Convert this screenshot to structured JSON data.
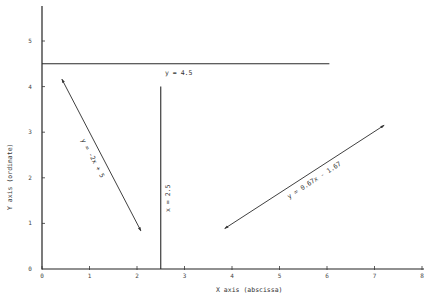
{
  "chart_data": {
    "type": "line",
    "title": "",
    "xlabel": "X axis (abscissa)",
    "ylabel": "Y axis (ordinate)",
    "xlim": [
      0,
      8
    ],
    "ylim": [
      0,
      5.6
    ],
    "x_ticks": [
      "0",
      "1",
      "2",
      "3",
      "4",
      "5",
      "6",
      "7",
      "8"
    ],
    "y_ticks": [
      "0",
      "1",
      "2",
      "3",
      "4",
      "5"
    ],
    "grid": false,
    "legend": "none",
    "series": [
      {
        "name": "y = 4.5",
        "kind": "horizontal",
        "points": [
          [
            0,
            4.5
          ],
          [
            6.05,
            4.5
          ]
        ],
        "arrows": false
      },
      {
        "name": "x = 2.5",
        "kind": "vertical",
        "points": [
          [
            2.5,
            0
          ],
          [
            2.5,
            4.0
          ]
        ],
        "arrows": false
      },
      {
        "name": "y = -2x + 5",
        "kind": "segment",
        "points": [
          [
            0.42,
            4.16
          ],
          [
            2.08,
            0.84
          ]
        ],
        "arrows": true
      },
      {
        "name": "y = 0.67x - 1.67",
        "kind": "segment",
        "points": [
          [
            3.85,
            0.89
          ],
          [
            7.2,
            3.15
          ]
        ],
        "arrows": true
      }
    ]
  },
  "labels": {
    "eq_h": "y = 4.5",
    "eq_v": "x = 2.5",
    "eq_neg": "y = -2x + 5",
    "eq_pos": "y = 0.67x - 1.67",
    "xlabel": "X axis (abscissa)",
    "ylabel": "Y axis (ordinate)"
  }
}
